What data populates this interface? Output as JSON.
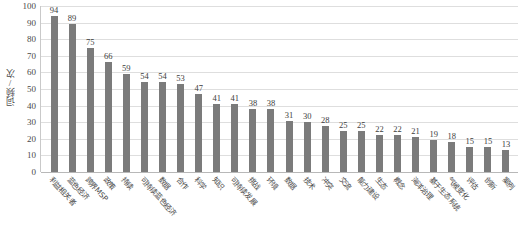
{
  "chart_data": {
    "type": "bar",
    "title": "",
    "subtitle": "",
    "xlabel": "",
    "ylabel": "词频/次",
    "ylim": [
      0,
      100
    ],
    "ytick_step": 10,
    "yticks": [
      100,
      90,
      80,
      70,
      60,
      50,
      40,
      30,
      20,
      10,
      0
    ],
    "grid": true,
    "legend": false,
    "legend_position": "none",
    "bar_color": "#7b7b7b",
    "gridline_color": "#dedede",
    "axis_color": "#b8b8b8",
    "label_rotation_deg": 47,
    "categories": [
      "利益相关者",
      "蓝色经济",
      "跨界MSP",
      "政策",
      "持续",
      "可持续蓝色经济",
      "数据",
      "合作",
      "科学",
      "知识",
      "可持续发展",
      "挑战",
      "环境",
      "数据",
      "技术",
      "冲突",
      "交流",
      "能力建设",
      "生态",
      "概念",
      "海洋治理",
      "基于生态系统",
      "气候变化",
      "评估",
      "创新",
      "案例"
    ],
    "values": [
      94,
      89,
      75,
      66,
      59,
      54,
      54,
      53,
      47,
      41,
      41,
      38,
      38,
      31,
      30,
      28,
      25,
      25,
      22,
      22,
      21,
      19,
      18,
      15,
      15,
      13
    ]
  }
}
